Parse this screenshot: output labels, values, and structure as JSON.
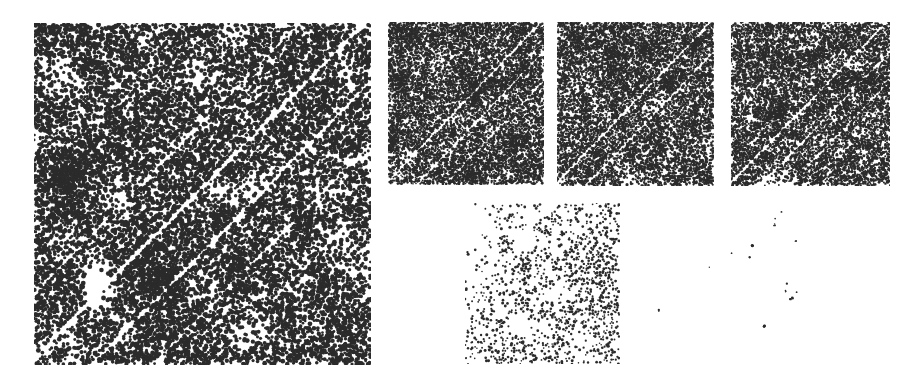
{
  "figure": {
    "background_color": "#ffffff",
    "dot_color": "#2b2b2b",
    "width": 924,
    "height": 391,
    "type": "dot-plot-matrix"
  },
  "chart_data": {
    "type": "scatter",
    "subtitle": "",
    "xlabel": "",
    "ylabel": "",
    "grid": false,
    "legend": "none",
    "axis_visible": false,
    "tick_labels": [],
    "annotations": [],
    "panels": [
      {
        "id": "panel-main",
        "label": "A",
        "role": "large-dot-matrix",
        "x": 34,
        "y": 23,
        "width": 337,
        "height": 342,
        "density": 0.52,
        "dot_size": 2.0,
        "seed": 1733,
        "diagonal_bands": [
          {
            "intercept": -0.02,
            "halfwidth": 0.012,
            "strength": 1.0
          },
          {
            "intercept": 0.17,
            "halfwidth": 0.01,
            "strength": 0.8
          },
          {
            "intercept": 0.35,
            "halfwidth": 0.009,
            "strength": 0.62
          },
          {
            "intercept": -0.21,
            "halfwidth": 0.008,
            "strength": 0.55
          },
          {
            "intercept": 0.52,
            "halfwidth": 0.007,
            "strength": 0.38
          }
        ],
        "blotch_count": 46,
        "blotch_scale": 0.055
      },
      {
        "id": "panel-top-1",
        "label": "B",
        "role": "small-dot-matrix",
        "x": 388,
        "y": 22,
        "width": 156,
        "height": 163,
        "density": 0.55,
        "dot_size": 1.3,
        "seed": 8821,
        "diagonal_bands": [
          {
            "intercept": -0.02,
            "halfwidth": 0.014,
            "strength": 1.0
          },
          {
            "intercept": 0.18,
            "halfwidth": 0.012,
            "strength": 0.78
          },
          {
            "intercept": 0.36,
            "halfwidth": 0.01,
            "strength": 0.58
          }
        ],
        "blotch_count": 30,
        "blotch_scale": 0.06
      },
      {
        "id": "panel-top-2",
        "label": "C",
        "role": "small-dot-matrix",
        "x": 557,
        "y": 22,
        "width": 157,
        "height": 164,
        "density": 0.55,
        "dot_size": 1.3,
        "seed": 4417,
        "diagonal_bands": [
          {
            "intercept": -0.02,
            "halfwidth": 0.014,
            "strength": 1.0
          },
          {
            "intercept": 0.18,
            "halfwidth": 0.012,
            "strength": 0.78
          },
          {
            "intercept": 0.36,
            "halfwidth": 0.01,
            "strength": 0.58
          }
        ],
        "blotch_count": 30,
        "blotch_scale": 0.06
      },
      {
        "id": "panel-top-3",
        "label": "D",
        "role": "small-dot-matrix",
        "x": 731,
        "y": 22,
        "width": 159,
        "height": 164,
        "density": 0.55,
        "dot_size": 1.3,
        "seed": 6195,
        "diagonal_bands": [
          {
            "intercept": -0.02,
            "halfwidth": 0.014,
            "strength": 1.0
          },
          {
            "intercept": 0.18,
            "halfwidth": 0.012,
            "strength": 0.78
          },
          {
            "intercept": 0.36,
            "halfwidth": 0.01,
            "strength": 0.58
          }
        ],
        "blotch_count": 30,
        "blotch_scale": 0.06
      },
      {
        "id": "panel-bottom-sparse",
        "label": "E",
        "role": "sparse-dot-matrix",
        "x": 465,
        "y": 203,
        "width": 155,
        "height": 161,
        "density": 0.1,
        "dot_size": 1.25,
        "seed": 3307,
        "diagonal_bands": [
          {
            "intercept": -0.02,
            "halfwidth": 0.03,
            "strength": -0.55
          },
          {
            "intercept": 0.2,
            "halfwidth": 0.026,
            "strength": -0.45
          }
        ],
        "blotch_count": 22,
        "blotch_scale": 0.1,
        "gradient": {
          "corner": "top-left",
          "min": 0.02,
          "max": 0.2
        }
      }
    ],
    "speck_field": {
      "id": "speck-field-right",
      "x": 640,
      "y": 195,
      "width": 284,
      "height": 196,
      "dot_color": "#2b2b2b",
      "points": [
        {
          "x": 0.495,
          "y": 0.085,
          "r": 1.1
        },
        {
          "x": 0.478,
          "y": 0.12,
          "r": 1.0
        },
        {
          "x": 0.472,
          "y": 0.15,
          "r": 1.3
        },
        {
          "x": 0.474,
          "y": 0.16,
          "r": 1.0
        },
        {
          "x": 0.547,
          "y": 0.233,
          "r": 1.1
        },
        {
          "x": 0.393,
          "y": 0.262,
          "r": 1.4
        },
        {
          "x": 0.399,
          "y": 0.258,
          "r": 1.2
        },
        {
          "x": 0.32,
          "y": 0.296,
          "r": 1.1
        },
        {
          "x": 0.385,
          "y": 0.317,
          "r": 1.1
        },
        {
          "x": 0.247,
          "y": 0.37,
          "r": 1.1
        },
        {
          "x": 0.517,
          "y": 0.451,
          "r": 1.1
        },
        {
          "x": 0.513,
          "y": 0.489,
          "r": 1.0
        },
        {
          "x": 0.552,
          "y": 0.497,
          "r": 1.1
        },
        {
          "x": 0.528,
          "y": 0.529,
          "r": 1.5
        },
        {
          "x": 0.535,
          "y": 0.527,
          "r": 1.3
        },
        {
          "x": 0.064,
          "y": 0.59,
          "r": 1.1
        },
        {
          "x": 0.439,
          "y": 0.668,
          "r": 1.4
        }
      ]
    }
  }
}
